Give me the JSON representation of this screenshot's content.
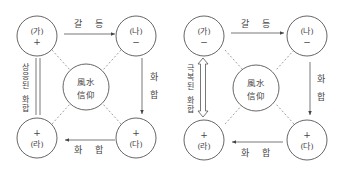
{
  "diagrams": [
    {
      "id": "left",
      "nodes": {
        "ga": {
          "label": "(가)",
          "sign": "+"
        },
        "na": {
          "label": "(나)",
          "sign": "−"
        },
        "da": {
          "label": "(다)",
          "sign": "+"
        },
        "ra": {
          "label": "(라)",
          "sign": "+"
        }
      },
      "center": {
        "line1": "風水",
        "line2": "信仰"
      },
      "edges": {
        "top": "갈 등",
        "right": [
          "화",
          "합"
        ],
        "bottom": "화 합",
        "left": [
          "상",
          "응",
          "된",
          "",
          "화",
          "합"
        ]
      },
      "left_connector": "double-line"
    },
    {
      "id": "right",
      "nodes": {
        "ga": {
          "label": "(가)",
          "sign": "−"
        },
        "na": {
          "label": "(나)",
          "sign": "−"
        },
        "da": {
          "label": "(다)",
          "sign": "+"
        },
        "ra": {
          "label": "(라)",
          "sign": "+"
        }
      },
      "center": {
        "line1": "風水",
        "line2": "信仰"
      },
      "edges": {
        "top": "갈 등",
        "right": [
          "화",
          "합"
        ],
        "bottom": "화 합",
        "left": [
          "극",
          "복",
          "된",
          "",
          "화",
          "합"
        ]
      },
      "left_connector": "double-headed-hollow-arrow"
    }
  ],
  "colors": {
    "stroke": "#555555",
    "text": "#444444",
    "dashed": "#888888"
  }
}
